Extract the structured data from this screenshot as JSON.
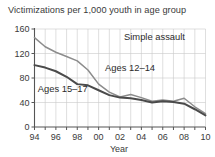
{
  "chart_data": {
    "type": "line",
    "title": "Victimizations per 1,000 youth in age group",
    "xlabel": "Year",
    "ylabel": "",
    "annotation": "Simple assault",
    "x": [
      1994,
      1995,
      1996,
      1997,
      1998,
      1999,
      2000,
      2001,
      2002,
      2003,
      2004,
      2005,
      2006,
      2007,
      2008,
      2009,
      2010
    ],
    "xtick_labels": [
      "94",
      "96",
      "98",
      "00",
      "02",
      "04",
      "06",
      "08",
      "10"
    ],
    "xtick_values": [
      1994,
      1996,
      1998,
      2000,
      2002,
      2004,
      2006,
      2008,
      2010
    ],
    "ytick_labels": [
      "0",
      "40",
      "80",
      "120",
      "160"
    ],
    "ytick_values": [
      0,
      40,
      80,
      120,
      160
    ],
    "ylim": [
      0,
      160
    ],
    "xlim": [
      1994,
      2010
    ],
    "grid": true,
    "legend": "inline-annotations",
    "series": [
      {
        "name": "Ages 12–14",
        "color": "#8c8c8c",
        "label_x": 2000.6,
        "label_y": 92,
        "values": [
          146,
          131,
          122,
          115,
          108,
          93,
          70,
          57,
          49,
          53,
          48,
          42,
          44,
          42,
          47,
          33,
          22
        ]
      },
      {
        "name": "Ages 15–17",
        "color": "#4a4a4a",
        "label_x": 1994.3,
        "label_y": 57,
        "values": [
          101,
          97,
          91,
          82,
          70,
          68,
          60,
          52,
          48,
          47,
          44,
          40,
          42,
          41,
          38,
          29,
          19
        ]
      }
    ]
  }
}
